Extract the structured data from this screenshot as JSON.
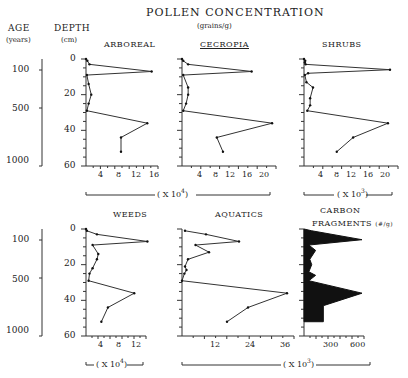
{
  "figure": {
    "title": "POLLEN    CONCENTRATION",
    "subtitle": "(grains/g)",
    "age_header": "AGE",
    "age_unit": "(years)",
    "depth_header": "DEPTH",
    "depth_unit": "(cm)",
    "age_ticks": [
      "100",
      "500",
      "1000"
    ],
    "depth_ticks": [
      "0",
      "20",
      "40",
      "60"
    ],
    "multiplier_e4": "( X 10",
    "exp4": "4",
    "exp3": "3",
    "close_paren": ")"
  },
  "chart_data": [
    {
      "type": "line",
      "title": "ARBOREAL",
      "xlabel": "( X 10^4 )",
      "ylabel": "DEPTH (cm)",
      "xlim": [
        0,
        16
      ],
      "ylim": [
        60,
        0
      ],
      "xticks": [
        "4",
        "8",
        "12",
        "16"
      ],
      "depth": [
        0,
        1,
        3,
        7,
        9,
        14,
        20,
        25,
        29,
        36,
        44,
        52
      ],
      "values": [
        0,
        0.3,
        0.8,
        15,
        0.2,
        0.6,
        1.2,
        0.6,
        0.2,
        14,
        8,
        8
      ]
    },
    {
      "type": "line",
      "title": "CECROPIA",
      "xlabel": "( X 10^4 )",
      "ylabel": "DEPTH (cm)",
      "xlim": [
        0,
        22
      ],
      "ylim": [
        60,
        0
      ],
      "xticks": [
        "4",
        "8",
        "12",
        "16",
        "20"
      ],
      "depth": [
        0,
        1,
        3,
        7,
        9,
        16,
        20,
        25,
        29,
        36,
        44,
        52
      ],
      "values": [
        0,
        0.3,
        1.5,
        17,
        0.3,
        1.5,
        1.5,
        1.0,
        0.3,
        22,
        8.5,
        10
      ]
    },
    {
      "type": "line",
      "title": "SHRUBS",
      "xlabel": "( X 10^3 )",
      "ylabel": "DEPTH (cm)",
      "xlim": [
        0,
        22
      ],
      "ylim": [
        60,
        0
      ],
      "xticks": [
        "4",
        "8",
        "12",
        "16",
        "20"
      ],
      "depth": [
        0,
        1,
        2,
        3,
        6,
        8,
        9,
        13,
        16,
        22,
        26,
        29,
        36,
        44,
        52
      ],
      "values": [
        0,
        0.3,
        0.2,
        0.4,
        21,
        1,
        0.2,
        0.6,
        2.2,
        1.5,
        1.5,
        0.8,
        20.5,
        12,
        8
      ]
    },
    {
      "type": "line",
      "title": "WEEDS",
      "xlabel": "( X 10^4 )",
      "ylabel": "DEPTH (cm)",
      "xlim": [
        0,
        14
      ],
      "ylim": [
        60,
        0
      ],
      "xticks": [
        "4",
        "8",
        "12"
      ],
      "depth": [
        0,
        1,
        3,
        7,
        9,
        14,
        17,
        22,
        25,
        29,
        36,
        44,
        52
      ],
      "values": [
        0,
        0.2,
        2.5,
        14,
        1.5,
        2.8,
        2.5,
        1.5,
        0.8,
        0.6,
        11,
        5,
        3.5
      ]
    },
    {
      "type": "line",
      "title": "AQUATICS",
      "xlabel": "( X 10^3 )",
      "ylabel": "DEPTH (cm)",
      "xlim": [
        0,
        36
      ],
      "ylim": [
        60,
        0
      ],
      "xticks": [
        "12",
        "24",
        "36"
      ],
      "depth": [
        1,
        3,
        7,
        9,
        13,
        17,
        21,
        23,
        25,
        29,
        36,
        44,
        52
      ],
      "values": [
        1,
        8,
        19,
        4.5,
        9,
        2,
        1,
        1.5,
        0.8,
        0,
        35,
        22,
        15
      ]
    },
    {
      "type": "area",
      "title": "CARBON FRAGMENTS (#/g)",
      "xlabel": "",
      "ylabel": "DEPTH (cm)",
      "xlim": [
        0,
        600
      ],
      "ylim": [
        60,
        0
      ],
      "xticks": [
        "300",
        "600"
      ],
      "depth": [
        0,
        1,
        6,
        9,
        12,
        17,
        20,
        24,
        26,
        29,
        36,
        43,
        52
      ],
      "values": [
        0,
        80,
        600,
        50,
        120,
        60,
        80,
        50,
        120,
        50,
        600,
        200,
        200
      ]
    }
  ]
}
